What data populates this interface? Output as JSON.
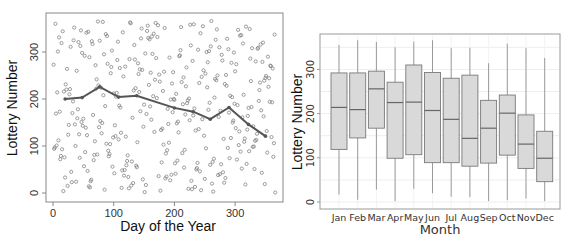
{
  "chart_data": [
    {
      "type": "scatter",
      "title": "",
      "xlabel": "Day of the Year",
      "ylabel": "Lottery Number",
      "xlim": [
        0,
        366
      ],
      "ylim": [
        0,
        366
      ],
      "xticks": [
        0,
        100,
        200,
        300
      ],
      "yticks": [
        0,
        100,
        200,
        300
      ],
      "grid": false,
      "legend": null,
      "series": [
        {
          "name": "draft lottery points",
          "kind": "scatter",
          "note": "366 points, one per day; appear uniformly scattered over 1-366"
        },
        {
          "name": "monthly mean trend",
          "kind": "line",
          "x": [
            20,
            48,
            77,
            108,
            138,
            200,
            231,
            259,
            290,
            322,
            350
          ],
          "y": [
            200,
            203,
            226,
            204,
            207,
            181,
            173,
            157,
            182,
            146,
            121
          ]
        }
      ]
    },
    {
      "type": "box",
      "title": "",
      "xlabel": "Month",
      "ylabel": "Lottery Number",
      "ylim": [
        0,
        366
      ],
      "yticks": [
        0,
        100,
        200,
        300
      ],
      "grid": true,
      "legend": null,
      "categories": [
        "Jan",
        "Feb",
        "Mar",
        "Apr",
        "May",
        "Jun",
        "Jul",
        "Aug",
        "Sep",
        "Oct",
        "Nov",
        "Dec"
      ],
      "boxes": [
        {
          "min": 17,
          "q1": 119,
          "median": 214,
          "q3": 292,
          "max": 355
        },
        {
          "min": 5,
          "q1": 145,
          "median": 209,
          "q3": 292,
          "max": 366
        },
        {
          "min": 28,
          "q1": 167,
          "median": 256,
          "q3": 296,
          "max": 362
        },
        {
          "min": 2,
          "q1": 99,
          "median": 225,
          "q3": 271,
          "max": 350
        },
        {
          "min": 30,
          "q1": 107,
          "median": 226,
          "q3": 310,
          "max": 363
        },
        {
          "min": 20,
          "q1": 89,
          "median": 207,
          "q3": 293,
          "max": 366
        },
        {
          "min": 12,
          "q1": 89,
          "median": 187,
          "q3": 280,
          "max": 348
        },
        {
          "min": 11,
          "q1": 81,
          "median": 144,
          "q3": 287,
          "max": 349
        },
        {
          "min": 2,
          "q1": 88,
          "median": 167,
          "q3": 230,
          "max": 314
        },
        {
          "min": 4,
          "q1": 106,
          "median": 201,
          "q3": 242,
          "max": 358
        },
        {
          "min": 8,
          "q1": 76,
          "median": 131,
          "q3": 197,
          "max": 348
        },
        {
          "min": 2,
          "q1": 46,
          "median": 99,
          "q3": 160,
          "max": 326
        }
      ]
    }
  ],
  "left_plot": {
    "xlabel": "Day of the Year",
    "ylabel": "Lottery Number",
    "xticks": [
      "0",
      "100",
      "200",
      "300"
    ],
    "yticks": [
      "0",
      "100",
      "200",
      "300"
    ]
  },
  "right_plot": {
    "xlabel": "Month",
    "ylabel": "Lottery Number",
    "yticks": [
      "0",
      "100",
      "200",
      "300"
    ],
    "months": [
      "Jan",
      "Feb",
      "Mar",
      "Apr",
      "May",
      "Jun",
      "Jul",
      "Aug",
      "Sep",
      "Oct",
      "Nov",
      "Dec"
    ]
  },
  "colors": {
    "frame": "#888888",
    "points": "#777777",
    "trend_line": "#555555",
    "box_fill": "#d9d9d9",
    "box_stroke": "#7a7a7a",
    "whisker": "#9a9a9a",
    "grid": "#f0f0f0"
  }
}
